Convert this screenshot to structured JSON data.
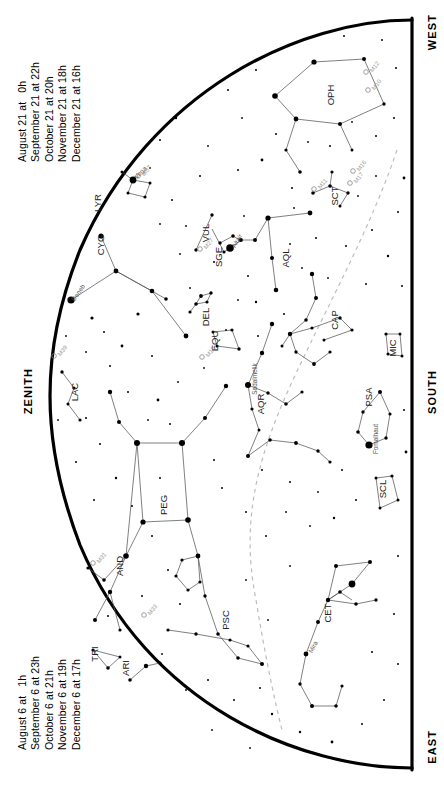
{
  "chart_title": "Evening Sky Star Chart",
  "timetable_top": {
    "name": "upper-date-time-list",
    "lines": [
      "August 21 at   0h",
      "September 21 at 22h",
      "October 21 at 20h",
      "November 21 at 18h",
      "December 21 at 16h"
    ]
  },
  "timetable_bottom": {
    "name": "lower-date-time-list",
    "lines": [
      "August 6 at   1h",
      "September 6 at 23h",
      "October 6 at 21h",
      "November 6 at 19h",
      "December 6 at 17h"
    ]
  },
  "cardinals": {
    "west": "WEST",
    "south": "SOUTH",
    "east": "EAST",
    "zenith": "ZENITH"
  },
  "chart_data": {
    "type": "scatter",
    "xlabel": "",
    "ylabel": "",
    "projection": "horizon-arc (half sky dome, west at top, east at bottom, zenith at left)",
    "grid": false,
    "legend_position": "none",
    "xlim": [
      0,
      444
    ],
    "ylim": [
      0,
      788
    ],
    "horizon": {
      "description": "thick black arc marking the horizon; straight meridian edge on the right",
      "stroke": "#000000",
      "stroke_width": 3.2
    },
    "ecliptic": {
      "description": "light grey dashed curve (the ecliptic)",
      "stroke": "#b8b8b8",
      "dash": "4,4"
    },
    "constellations": [
      {
        "abbr": "OPH",
        "label_x": 334,
        "label_y": 95,
        "rot": -90
      },
      {
        "abbr": "SCT",
        "label_x": 338,
        "label_y": 196,
        "rot": -90
      },
      {
        "abbr": "AQL",
        "label_x": 289,
        "label_y": 258,
        "rot": -90
      },
      {
        "abbr": "SGE",
        "label_x": 222,
        "label_y": 257,
        "rot": -90
      },
      {
        "abbr": "VUL",
        "label_x": 209,
        "label_y": 233,
        "rot": -90
      },
      {
        "abbr": "CYG",
        "label_x": 104,
        "label_y": 245,
        "rot": -90
      },
      {
        "abbr": "LYR",
        "label_x": 101,
        "label_y": 203,
        "rot": -90
      },
      {
        "abbr": "LAC",
        "label_x": 78,
        "label_y": 392,
        "rot": -90
      },
      {
        "abbr": "DEL",
        "label_x": 209,
        "label_y": 317,
        "rot": -90
      },
      {
        "abbr": "EQU",
        "label_x": 218,
        "label_y": 341,
        "rot": -90
      },
      {
        "abbr": "AQR",
        "label_x": 264,
        "label_y": 404,
        "rot": -90
      },
      {
        "abbr": "CAP",
        "label_x": 338,
        "label_y": 320,
        "rot": -90
      },
      {
        "abbr": "MIC",
        "label_x": 396,
        "label_y": 348,
        "rot": -90
      },
      {
        "abbr": "PSA",
        "label_x": 372,
        "label_y": 397,
        "rot": -90
      },
      {
        "abbr": "SCL",
        "label_x": 386,
        "label_y": 489,
        "rot": -90
      },
      {
        "abbr": "PEG",
        "label_x": 167,
        "label_y": 505,
        "rot": -90
      },
      {
        "abbr": "AND",
        "label_x": 123,
        "label_y": 566,
        "rot": -90
      },
      {
        "abbr": "PSC",
        "label_x": 229,
        "label_y": 620,
        "rot": -90
      },
      {
        "abbr": "CET",
        "label_x": 331,
        "label_y": 613,
        "rot": -90
      },
      {
        "abbr": "ARI",
        "label_x": 129,
        "label_y": 668,
        "rot": -90
      },
      {
        "abbr": "TRI",
        "label_x": 98,
        "label_y": 654,
        "rot": -90
      }
    ],
    "named_stars": [
      {
        "name": "Deneb",
        "x": 71,
        "y": 300,
        "mag": 1.3,
        "label_rot": -55
      },
      {
        "name": "Vega",
        "x": 133,
        "y": 180,
        "mag": 0.0,
        "label_rot": -45
      },
      {
        "name": "Altair",
        "x": 230,
        "y": 248,
        "mag": 0.8,
        "label_rot": -60
      },
      {
        "name": "Sadalmelik",
        "x": 248,
        "y": 385,
        "mag": 3.0,
        "label_rot": -90
      },
      {
        "name": "Fomalhaut",
        "x": 369,
        "y": 445,
        "mag": 1.2,
        "label_rot": -90
      },
      {
        "name": "Mira",
        "x": 306,
        "y": 654,
        "mag": 3.5,
        "label_rot": -60
      }
    ],
    "deep_sky_objects": [
      {
        "name": "M57",
        "x": 138,
        "y": 176,
        "type": "planetary-nebula"
      },
      {
        "name": "M27",
        "x": 200,
        "y": 249,
        "type": "planetary-nebula"
      },
      {
        "name": "M12",
        "x": 366,
        "y": 72,
        "type": "globular-cluster"
      },
      {
        "name": "M10",
        "x": 368,
        "y": 90,
        "type": "globular-cluster"
      },
      {
        "name": "M11",
        "x": 314,
        "y": 189,
        "type": "open-cluster"
      },
      {
        "name": "M16",
        "x": 353,
        "y": 171,
        "type": "open-cluster"
      },
      {
        "name": "M17",
        "x": 350,
        "y": 183,
        "type": "nebula"
      },
      {
        "name": "M39",
        "x": 54,
        "y": 356,
        "type": "open-cluster"
      },
      {
        "name": "M15",
        "x": 202,
        "y": 357,
        "type": "globular-cluster"
      },
      {
        "name": "M31",
        "x": 93,
        "y": 563,
        "type": "galaxy"
      },
      {
        "name": "M33",
        "x": 144,
        "y": 615,
        "type": "galaxy"
      }
    ],
    "star_counts": {
      "plotted_stars": 180,
      "labeled_constellations": 21,
      "labeled_stars": 6,
      "labeled_dso": 11
    }
  }
}
